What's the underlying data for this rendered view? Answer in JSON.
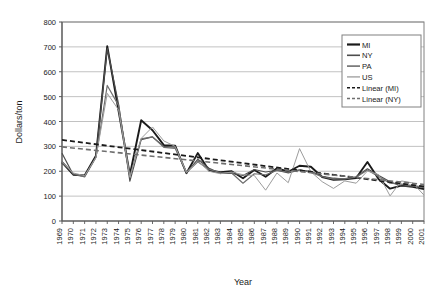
{
  "chart_data": {
    "type": "line",
    "title": "",
    "xlabel": "Year",
    "ylabel": "Dollars/ton",
    "xlim": [
      1969,
      2001
    ],
    "ylim": [
      0,
      800
    ],
    "ytick_step": 100,
    "grid": "horizontal",
    "legend_position": "top-right",
    "yticks": [
      "0",
      "100",
      "200",
      "300",
      "400",
      "500",
      "600",
      "700",
      "800"
    ],
    "categories": [
      "1969",
      "1970",
      "1971",
      "1972",
      "1973",
      "1974",
      "1975",
      "1976",
      "1977",
      "1978",
      "1979",
      "1980",
      "1981",
      "1982",
      "1983",
      "1984",
      "1985",
      "1986",
      "1987",
      "1988",
      "1989",
      "1990",
      "1991",
      "1992",
      "1993",
      "1994",
      "1995",
      "1996",
      "1997",
      "1998",
      "1999",
      "2000",
      "2001"
    ],
    "series": [
      {
        "name": "MI",
        "color": "#1a1a1a",
        "width": 1.9,
        "dash": "none",
        "values": [
          236,
          186,
          183,
          262,
          703,
          443,
          186,
          405,
          365,
          305,
          303,
          192,
          273,
          203,
          196,
          200,
          172,
          205,
          178,
          212,
          198,
          222,
          218,
          177,
          166,
          168,
          173,
          237,
          168,
          130,
          142,
          137,
          128
        ]
      },
      {
        "name": "NY",
        "color": "#4d4d4d",
        "width": 1.2,
        "dash": "none",
        "values": [
          272,
          186,
          180,
          258,
          694,
          470,
          160,
          327,
          338,
          300,
          297,
          193,
          248,
          212,
          192,
          191,
          183,
          207,
          197,
          204,
          193,
          205,
          200,
          180,
          172,
          168,
          178,
          210,
          183,
          158,
          140,
          140,
          135
        ]
      },
      {
        "name": "PA",
        "color": "#6e6e6e",
        "width": 1.2,
        "dash": "none",
        "values": [
          240,
          190,
          177,
          255,
          545,
          465,
          181,
          330,
          338,
          296,
          292,
          195,
          238,
          207,
          195,
          193,
          152,
          190,
          186,
          203,
          197,
          206,
          195,
          178,
          168,
          170,
          176,
          205,
          178,
          152,
          148,
          142,
          136
        ]
      },
      {
        "name": "US",
        "color": "#9c9c9c",
        "width": 1.0,
        "dash": "none",
        "values": [
          235,
          193,
          182,
          255,
          513,
          447,
          176,
          332,
          378,
          322,
          300,
          196,
          240,
          200,
          190,
          197,
          186,
          183,
          124,
          193,
          154,
          291,
          198,
          158,
          131,
          161,
          152,
          201,
          186,
          101,
          161,
          153,
          104
        ]
      }
    ],
    "trendlines": [
      {
        "name": "Linear (MI)",
        "color": "#1a1a1a",
        "width": 1.8,
        "dash": "5,3",
        "start": {
          "x": 1969,
          "y": 326
        },
        "end": {
          "x": 2001,
          "y": 139
        }
      },
      {
        "name": "Linear (NY)",
        "color": "#6e6e6e",
        "width": 1.6,
        "dash": "5,3",
        "start": {
          "x": 1969,
          "y": 298
        },
        "end": {
          "x": 2001,
          "y": 147
        }
      }
    ],
    "legend": [
      {
        "label": "MI",
        "color": "#1a1a1a",
        "dash": "none",
        "width": 2.2
      },
      {
        "label": "NY",
        "color": "#4d4d4d",
        "dash": "none",
        "width": 1.6
      },
      {
        "label": "PA",
        "color": "#6e6e6e",
        "dash": "none",
        "width": 1.6
      },
      {
        "label": "US",
        "color": "#9c9c9c",
        "dash": "none",
        "width": 1.3
      },
      {
        "label": "Linear (MI)",
        "color": "#1a1a1a",
        "dash": "3,2",
        "width": 1.6
      },
      {
        "label": "Linear (NY)",
        "color": "#6e6e6e",
        "dash": "3,2",
        "width": 1.6
      }
    ],
    "colors": {
      "plot_border": "#808080",
      "gridline": "#b3b3b3",
      "axis": "#595959",
      "legend_border": "#808080",
      "background": "#ffffff"
    }
  }
}
